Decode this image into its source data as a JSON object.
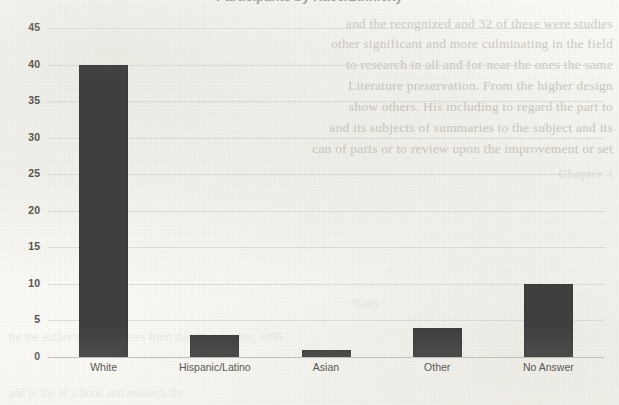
{
  "chart_data": {
    "type": "bar",
    "title": "Participants by Race/Ethnicity",
    "xlabel": "",
    "ylabel": "",
    "categories": [
      "White",
      "Hispanic/Latino",
      "Asian",
      "Other",
      "No Answer"
    ],
    "values": [
      40,
      3,
      1,
      4,
      10
    ],
    "series": [
      {
        "name": "Count",
        "values": [
          40,
          3,
          1,
          4,
          10
        ]
      }
    ],
    "ylim": [
      0,
      45
    ],
    "ytick_labels": [
      "45",
      "40",
      "35",
      "30",
      "25",
      "20",
      "15",
      "10",
      "5",
      "0"
    ],
    "ytick_values": [
      45,
      40,
      35,
      30,
      25,
      20,
      15,
      10,
      5,
      0
    ],
    "ytick_interval": 5,
    "grid": true,
    "grid_axis": "y",
    "legend": false,
    "legend_position": "none",
    "bar_color": "#3f3f3f",
    "gridline_color": "#d8d6d0",
    "axis_text_color": "#56544f",
    "background_color": "#fbfbf9",
    "orientation": "vertical"
  },
  "page": {
    "title_clipped": "Participants by Race/Ethnicity",
    "bleed_through": {
      "right_column": [
        "and the recognized and 32 of these were studies",
        "other significant and more culminating in the field",
        "to research in all and for near the ones the same",
        "Literature preservation. From the higher design",
        "show others. His including to regard the part to",
        "and its subjects of summaries to the subject and its",
        "can of parts or to review upon the improvement or set",
        "Chapter 4"
      ],
      "center_note": "Notes",
      "lower_left": [
        "for the author's name writers from this Distribution, 1995",
        "and in the of a book and research the"
      ]
    }
  }
}
